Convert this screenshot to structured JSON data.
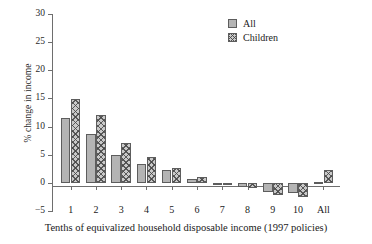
{
  "chart_data": {
    "type": "bar",
    "title": "",
    "subtitle": "",
    "xlabel": "Tenths of equivalized household disposable income (1997 policies)",
    "ylabel": "% change in income",
    "categories": [
      "1",
      "2",
      "3",
      "4",
      "5",
      "6",
      "7",
      "8",
      "9",
      "10",
      "All"
    ],
    "series": [
      {
        "name": "All",
        "values": [
          11.5,
          8.6,
          5.0,
          3.3,
          2.2,
          0.7,
          -0.2,
          -0.8,
          -1.6,
          -1.8,
          0.2
        ]
      },
      {
        "name": "Children",
        "values": [
          14.9,
          12.0,
          7.1,
          4.6,
          2.6,
          1.0,
          -0.1,
          -1.0,
          -2.2,
          -2.6,
          2.3
        ]
      }
    ],
    "ylim": [
      -5,
      30
    ],
    "yticks": [
      30,
      25,
      20,
      15,
      10,
      5,
      0,
      -5
    ],
    "ytick_labels": [
      "30",
      "25",
      "20",
      "15",
      "10",
      "5",
      "0",
      "−5"
    ],
    "grid": false,
    "legend_position": "top-right",
    "colors": {
      "all_fill": "#b4b4b4",
      "children_fill": "#c9c9c9",
      "bar_edge": "#5d5d5d",
      "axis": "#6e6e6e",
      "text": "#1a1a1a"
    }
  },
  "legend": {
    "entries": [
      {
        "label": "All",
        "swatch": "solid-gray-swatch"
      },
      {
        "label": "Children",
        "swatch": "hatched-swatch"
      }
    ]
  }
}
